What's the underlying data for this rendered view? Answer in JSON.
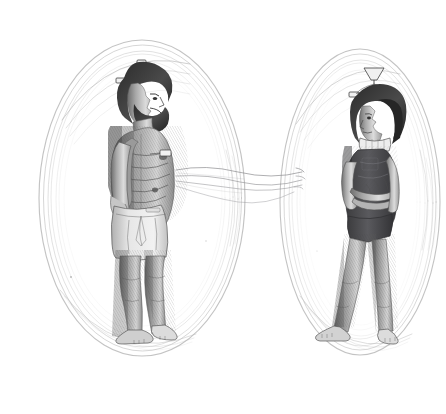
{
  "image": {
    "title": "Two figures enclosed in oval auras linked by wavy energy lines",
    "medium": "pen-and-ink engraving style line drawing",
    "palette": "monochrome grayscale on white",
    "background_color": "#ffffff",
    "ink_color": "#3a3a3a",
    "aura_color": "#b9b9b9",
    "wave_color": "#8f8f93",
    "width": 446,
    "height": 414
  },
  "scene": {
    "figure_count": 2,
    "aura_count": 2,
    "connector_count": 4,
    "caption": ""
  },
  "figures": [
    {
      "id": "left-figure",
      "label": "Bearded man standing in profile",
      "sex": "male",
      "pose": "standing upright, facing right, arms at sides",
      "build": "heavyset, rounded abdomen",
      "hair": "dark curly hair and full beard",
      "clothing": "light knee-length drawstring shorts",
      "barefoot": true,
      "headgear": "cranial antenna array with vertical post and side electrodes",
      "aura": {
        "shape": "vertical oval",
        "center_x": 142,
        "center_y": 198,
        "radius_x": 103,
        "radius_y": 158,
        "stroke_rings": 7
      },
      "emission_origin": {
        "x": 176,
        "y": 178,
        "region": "navel / solar plexus"
      }
    },
    {
      "id": "right-figure",
      "label": "Short-haired woman standing with arms crossed",
      "sex": "female",
      "pose": "standing, facing left, arms folded across chest, legs crossed at ankles",
      "build": "slender",
      "hair": "dark bobbed hair",
      "clothing": "dark sleeveless one-piece leotard with pale collar",
      "barefoot": true,
      "headgear": "cranial antenna array with funnel-shaped crown piece and side electrodes",
      "aura": {
        "shape": "vertical oval",
        "center_x": 360,
        "center_y": 202,
        "radius_x": 80,
        "radius_y": 153,
        "stroke_rings": 7
      },
      "reception_point": {
        "x": 300,
        "y": 178,
        "region": "left side of torso"
      }
    }
  ],
  "connectors": {
    "label": "wavy energy transmission lines",
    "description": "Four thin undulating lines issue from the male figure's abdomen and travel rightward, tapering to points near the female figure's aura",
    "count": 4,
    "start_x": 176,
    "end_x": 303,
    "baseline_y": 178
  },
  "annotations": {
    "left_figure_name": "Transmitter",
    "right_figure_name": "Receiver",
    "overlay_text": ""
  }
}
